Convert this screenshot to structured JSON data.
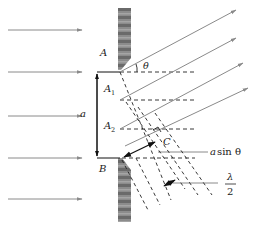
{
  "diagram": {
    "labels": {
      "A": "A",
      "A1": "A",
      "A1_sub": "1",
      "A2": "A",
      "A2_sub": "2",
      "B": "B",
      "C": "C",
      "a": "a",
      "theta": "θ",
      "asin_a": "a",
      "asin_rest": "sin θ",
      "lambda": "λ",
      "two": "2"
    },
    "incident_rays": 5,
    "diffracted_rays": 4,
    "colors": {
      "ray": "#8a8a8a",
      "dash": "#222222",
      "line": "#222222",
      "barrier_dark": "#555555",
      "barrier_light": "#9a9a9a"
    }
  }
}
